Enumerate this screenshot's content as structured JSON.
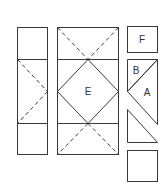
{
  "diagram": {
    "colors": {
      "line": "#3a3a3a",
      "label": "#333333",
      "background": "#ffffff"
    },
    "labels": {
      "center_diamond": "E",
      "corner_square": "F",
      "small_triangle": "B",
      "large_triangle": "A"
    },
    "panels": [
      {
        "id": "left-column",
        "sections": [
          "square",
          "half-square with dashed X",
          "square"
        ]
      },
      {
        "id": "center-column",
        "sections": [
          "dashed X top",
          "diamond E",
          "dashed X bottom"
        ]
      },
      {
        "id": "pieces-column",
        "pieces": [
          "F square",
          "B/A triangles",
          "right triangle",
          "square"
        ]
      }
    ]
  }
}
